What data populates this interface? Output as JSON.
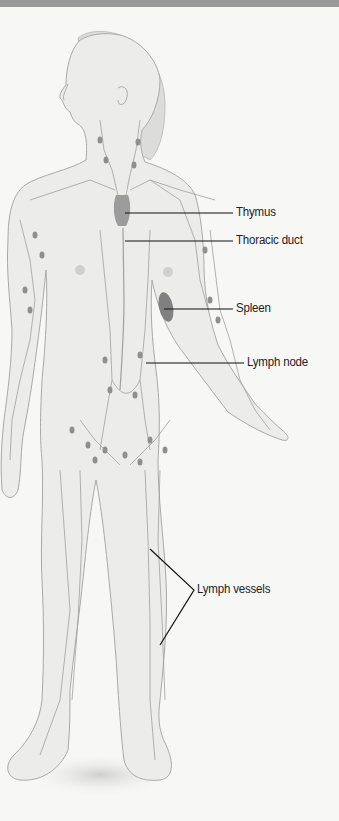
{
  "diagram": {
    "colors": {
      "background": "#f7f7f6",
      "top_band": "#9a9a9a",
      "body_fill": "#ececeb",
      "body_outline": "#a9a9a9",
      "lymph_node": "#8f8f8f",
      "spleen": "#808080",
      "thymus": "#9c9c9c",
      "leader_line": "#111111"
    },
    "labels": [
      {
        "id": "thymus",
        "text": "Thymus"
      },
      {
        "id": "thoracic-duct",
        "text": "Thoracic duct"
      },
      {
        "id": "spleen",
        "text": "Spleen"
      },
      {
        "id": "lymph-node",
        "text": "Lymph node"
      },
      {
        "id": "lymph-vessels",
        "text": "Lymph vessels"
      }
    ]
  }
}
